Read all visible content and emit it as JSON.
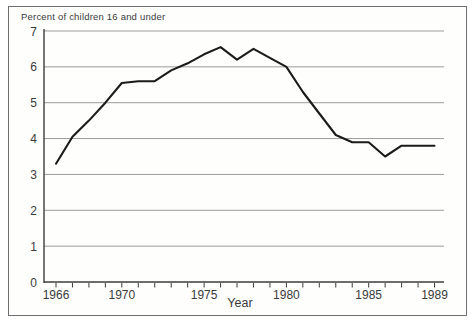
{
  "window": {
    "background": "#ffffff",
    "frame_border": "#6e6e6e"
  },
  "chart_data": {
    "type": "line",
    "title": "Percent of children 16 and under",
    "xlabel": "Year",
    "ylabel": "",
    "x": [
      1966,
      1967,
      1968,
      1969,
      1970,
      1971,
      1972,
      1973,
      1974,
      1975,
      1976,
      1977,
      1978,
      1979,
      1980,
      1981,
      1982,
      1983,
      1984,
      1985,
      1986,
      1987,
      1988,
      1989
    ],
    "values": [
      3.3,
      4.05,
      4.5,
      5.0,
      5.55,
      5.6,
      5.6,
      5.9,
      6.1,
      6.35,
      6.55,
      6.2,
      6.5,
      6.25,
      6.0,
      5.3,
      4.7,
      4.1,
      3.9,
      3.9,
      3.5,
      3.8,
      3.8,
      3.8
    ],
    "ylim": [
      0,
      7
    ],
    "yticks": [
      0,
      1,
      2,
      3,
      4,
      5,
      6,
      7
    ],
    "xticks_labeled": [
      1966,
      1970,
      1975,
      1980,
      1985,
      1989
    ],
    "xticks_every_year": true,
    "grid": "horizontal",
    "legend": "none",
    "line_color": "#1b1b1b",
    "grid_color": "#9b9b9b",
    "axis_color": "#3c3c3c",
    "text_color": "#3a3a3a"
  }
}
